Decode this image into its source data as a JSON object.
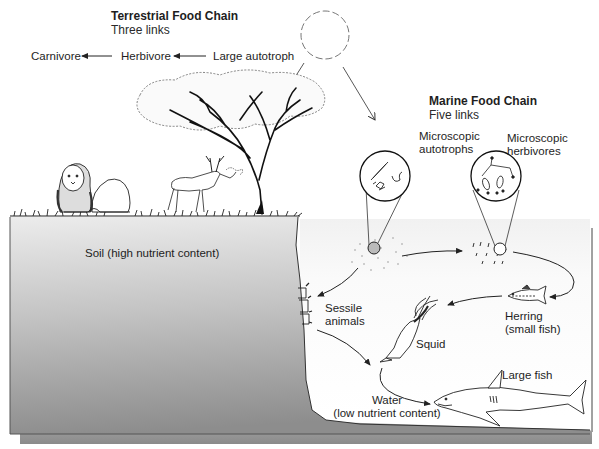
{
  "terrestrial": {
    "title": "Terrestrial Food Chain",
    "subtitle": "Three links",
    "chain": [
      {
        "label": "Carnivore"
      },
      {
        "label": "Herbivore"
      },
      {
        "label": "Large autotroph"
      }
    ],
    "soil_label": "Soil (high nutrient content)",
    "icons": [
      "sun-icon",
      "tree-icon",
      "lion-icon",
      "deer-icon",
      "grass-icon"
    ]
  },
  "marine": {
    "title": "Marine Food Chain",
    "subtitle": "Five links",
    "organisms": {
      "autotrophs": {
        "line1": "Microscopic",
        "line2": "autotrophs"
      },
      "herbivores": {
        "line1": "Microscopic",
        "line2": "herbivores"
      },
      "herring": {
        "line1": "Herring",
        "line2": "(small fish)"
      },
      "squid": {
        "label": "Squid"
      },
      "large_fish": {
        "label": "Large fish"
      },
      "sessile": {
        "line1": "Sessile",
        "line2": "animals"
      },
      "water": {
        "line1": "Water",
        "line2": "(low nutrient content)"
      }
    },
    "icons": [
      "magnifier-circle-icon",
      "plankton-icon",
      "herring-icon",
      "squid-icon",
      "shark-icon",
      "sessile-animals-icon"
    ]
  },
  "colors": {
    "soil_top": "#e6e6e6",
    "soil_bottom": "#8f8f8f",
    "water_top": "#f4f4f4",
    "water_bottom": "#ffffff",
    "seabed": "#9a9a9a",
    "line": "#222222"
  }
}
